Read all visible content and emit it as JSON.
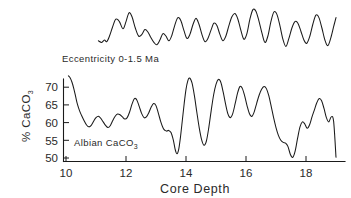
{
  "chart_data": {
    "type": "line",
    "title": "",
    "xlabel": "Core Depth",
    "ylabel": "% CaCO3",
    "xlim": [
      9.6,
      19.3
    ],
    "ylim": [
      48.5,
      74.5
    ],
    "xticks": [
      10,
      12,
      14,
      16,
      18
    ],
    "xtick_labels": [
      "10",
      "12",
      "14",
      "16",
      "18"
    ],
    "yticks": [
      50,
      55,
      60,
      65,
      70
    ],
    "ytick_labels": [
      "50",
      "55",
      "60",
      "65",
      "70"
    ],
    "grid": false,
    "legend": "none",
    "annotations": [
      {
        "text": "Eccentricity 0-1.5 Ma",
        "x": 11.1,
        "y_panel": "top"
      },
      {
        "text": "Albian CaCO3",
        "x": 11.0,
        "y": 53.5
      }
    ],
    "series": [
      {
        "name": "Eccentricity 0-1.5 Ma",
        "panel": "top",
        "units": "arbitrary",
        "x": [
          11.08,
          11.19,
          11.28,
          11.36,
          11.45,
          11.55,
          11.66,
          11.78,
          11.9,
          12.0,
          12.1,
          12.2,
          12.31,
          12.42,
          12.53,
          12.63,
          12.73,
          12.83,
          12.93,
          13.03,
          13.13,
          13.23,
          13.33,
          13.43,
          13.53,
          13.63,
          13.73,
          13.83,
          13.93,
          14.03,
          14.13,
          14.23,
          14.33,
          14.43,
          14.53,
          14.63,
          14.73,
          14.83,
          14.93,
          15.03,
          15.13,
          15.23,
          15.33,
          15.43,
          15.53,
          15.63,
          15.73,
          15.83,
          15.93,
          16.03,
          16.13,
          16.23,
          16.33,
          16.43,
          16.53,
          16.63,
          16.73,
          16.83,
          16.93,
          17.03,
          17.13,
          17.23,
          17.33,
          17.43,
          17.53,
          17.63,
          17.73,
          17.83,
          17.93,
          18.03,
          18.13,
          18.23,
          18.33,
          18.43,
          18.53,
          18.63,
          18.73,
          18.83,
          18.93,
          19.0
        ],
        "values": [
          0.18,
          0.14,
          0.2,
          0.16,
          0.3,
          0.52,
          0.72,
          0.66,
          0.48,
          0.66,
          0.88,
          0.78,
          0.5,
          0.3,
          0.34,
          0.46,
          0.4,
          0.26,
          0.14,
          0.08,
          0.2,
          0.36,
          0.3,
          0.18,
          0.32,
          0.58,
          0.76,
          0.68,
          0.44,
          0.24,
          0.34,
          0.58,
          0.74,
          0.6,
          0.34,
          0.16,
          0.24,
          0.44,
          0.62,
          0.56,
          0.34,
          0.18,
          0.3,
          0.56,
          0.78,
          0.86,
          0.72,
          0.44,
          0.22,
          0.36,
          0.72,
          0.96,
          0.92,
          0.68,
          0.38,
          0.14,
          0.3,
          0.66,
          0.9,
          0.84,
          0.56,
          0.22,
          0.04,
          0.24,
          0.5,
          0.66,
          0.62,
          0.42,
          0.2,
          0.12,
          0.3,
          0.6,
          0.82,
          0.76,
          0.5,
          0.2,
          0.06,
          0.26,
          0.56,
          0.76
        ]
      },
      {
        "name": "Albian CaCO3",
        "panel": "bottom",
        "units": "%",
        "x": [
          10.08,
          10.14,
          10.2,
          10.26,
          10.32,
          10.38,
          10.45,
          10.52,
          10.6,
          10.68,
          10.76,
          10.84,
          10.92,
          11.0,
          11.08,
          11.16,
          11.24,
          11.32,
          11.4,
          11.48,
          11.56,
          11.64,
          11.72,
          11.8,
          11.88,
          11.96,
          12.04,
          12.12,
          12.2,
          12.28,
          12.36,
          12.44,
          12.52,
          12.6,
          12.68,
          12.76,
          12.84,
          12.92,
          13.0,
          13.08,
          13.16,
          13.24,
          13.3,
          13.36,
          13.42,
          13.5,
          13.58,
          13.64,
          13.7,
          13.76,
          13.82,
          13.88,
          13.94,
          14.0,
          14.06,
          14.12,
          14.2,
          14.28,
          14.36,
          14.44,
          14.52,
          14.6,
          14.68,
          14.76,
          14.84,
          14.92,
          15.0,
          15.08,
          15.16,
          15.24,
          15.32,
          15.4,
          15.48,
          15.56,
          15.64,
          15.72,
          15.8,
          15.88,
          15.96,
          16.04,
          16.12,
          16.2,
          16.28,
          16.36,
          16.44,
          16.52,
          16.6,
          16.68,
          16.76,
          16.84,
          16.92,
          17.0,
          17.08,
          17.16,
          17.24,
          17.32,
          17.4,
          17.48,
          17.56,
          17.64,
          17.72,
          17.8,
          17.88,
          17.96,
          18.04,
          18.12,
          18.2,
          18.28,
          18.36,
          18.44,
          18.52,
          18.6,
          18.68,
          18.76,
          18.84,
          18.92,
          19.0
        ],
        "values": [
          73.2,
          72.6,
          71.4,
          69.6,
          67.4,
          65.2,
          63.4,
          62.0,
          60.6,
          59.4,
          58.8,
          59.2,
          60.4,
          61.4,
          61.8,
          61.2,
          60.2,
          59.2,
          58.6,
          59.2,
          60.6,
          61.8,
          62.4,
          62.2,
          61.6,
          61.0,
          61.4,
          63.0,
          65.2,
          66.8,
          66.4,
          64.6,
          62.6,
          61.4,
          61.6,
          62.8,
          64.4,
          65.4,
          64.8,
          62.6,
          60.2,
          58.4,
          57.8,
          57.6,
          57.8,
          57.2,
          55.0,
          52.4,
          51.2,
          52.6,
          56.2,
          60.8,
          65.4,
          69.4,
          71.8,
          72.6,
          71.2,
          67.6,
          63.0,
          58.6,
          55.2,
          53.6,
          54.8,
          58.6,
          63.4,
          67.8,
          70.8,
          72.2,
          71.4,
          68.6,
          65.2,
          62.4,
          61.4,
          62.6,
          65.4,
          68.4,
          70.2,
          69.6,
          67.4,
          64.6,
          62.4,
          61.8,
          63.2,
          65.6,
          67.8,
          69.4,
          70.2,
          69.6,
          67.6,
          64.6,
          61.4,
          58.6,
          56.4,
          55.0,
          54.4,
          54.2,
          53.2,
          51.0,
          50.2,
          52.0,
          55.6,
          58.8,
          60.2,
          59.6,
          58.4,
          59.4,
          61.6,
          63.6,
          65.6,
          66.8,
          66.2,
          64.0,
          61.4,
          60.2,
          61.6,
          60.4,
          50.2
        ]
      }
    ]
  },
  "axes": {
    "x_title": "Core Depth",
    "y_title_main": "% CaCO",
    "y_title_sub": "3",
    "x_tick_labels": [
      "10",
      "12",
      "14",
      "16",
      "18"
    ],
    "y_tick_labels": [
      "70",
      "65",
      "60",
      "55",
      "50"
    ]
  },
  "labels": {
    "eccentricity": "Eccentricity  0-1.5  Ma",
    "albian_main": "Albian CaCO",
    "albian_sub": "3"
  },
  "colors": {
    "ink": "#1a1a1a",
    "text": "#2a2a2a",
    "background": "#ffffff"
  }
}
